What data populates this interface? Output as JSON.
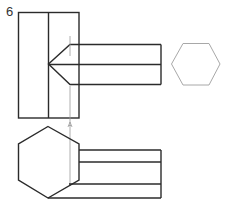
{
  "figure": {
    "number_label": "6",
    "stroke_color": "#2b2b2b",
    "thin_stroke_color": "#9a9a9a",
    "light_stroke_color": "#a8a8a8",
    "arrow_marker_text": "A"
  }
}
